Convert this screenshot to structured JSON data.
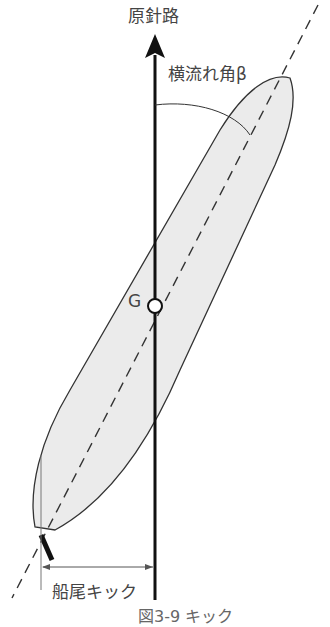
{
  "diagram": {
    "course_label": "原針路",
    "drift_angle_label": "横流れ角β",
    "center_label": "G",
    "stern_kick_label": "船尾キック",
    "caption": "図3-9  キック"
  },
  "colors": {
    "hull_fill": "#ebebeb",
    "line": "#222222",
    "text": "#444444"
  }
}
